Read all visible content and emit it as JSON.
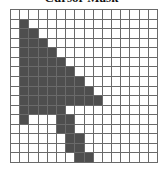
{
  "title": "Cursor Mask",
  "grid": {
    "rows": 16,
    "cols": 16,
    "filled_color": "#4e4e4e",
    "empty_color": "#ffffff",
    "line_color": "#6a6a6a",
    "filled_cells": [
      [
        1,
        1
      ],
      [
        2,
        1
      ],
      [
        2,
        2
      ],
      [
        3,
        1
      ],
      [
        3,
        2
      ],
      [
        3,
        3
      ],
      [
        4,
        1
      ],
      [
        4,
        2
      ],
      [
        4,
        3
      ],
      [
        4,
        4
      ],
      [
        5,
        1
      ],
      [
        5,
        2
      ],
      [
        5,
        3
      ],
      [
        5,
        4
      ],
      [
        5,
        5
      ],
      [
        6,
        1
      ],
      [
        6,
        2
      ],
      [
        6,
        3
      ],
      [
        6,
        4
      ],
      [
        6,
        5
      ],
      [
        6,
        6
      ],
      [
        7,
        1
      ],
      [
        7,
        2
      ],
      [
        7,
        3
      ],
      [
        7,
        4
      ],
      [
        7,
        5
      ],
      [
        7,
        6
      ],
      [
        7,
        7
      ],
      [
        8,
        1
      ],
      [
        8,
        2
      ],
      [
        8,
        3
      ],
      [
        8,
        4
      ],
      [
        8,
        5
      ],
      [
        8,
        6
      ],
      [
        8,
        7
      ],
      [
        8,
        8
      ],
      [
        9,
        1
      ],
      [
        9,
        2
      ],
      [
        9,
        3
      ],
      [
        9,
        4
      ],
      [
        9,
        5
      ],
      [
        9,
        6
      ],
      [
        9,
        7
      ],
      [
        9,
        8
      ],
      [
        9,
        9
      ],
      [
        10,
        1
      ],
      [
        10,
        2
      ],
      [
        10,
        3
      ],
      [
        10,
        4
      ],
      [
        10,
        5
      ],
      [
        11,
        1
      ],
      [
        11,
        5
      ],
      [
        11,
        6
      ],
      [
        12,
        5
      ],
      [
        12,
        6
      ],
      [
        13,
        6
      ],
      [
        13,
        7
      ],
      [
        14,
        6
      ],
      [
        14,
        7
      ],
      [
        15,
        7
      ],
      [
        15,
        8
      ]
    ]
  }
}
